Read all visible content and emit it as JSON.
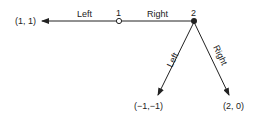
{
  "diagram": {
    "type": "game-tree",
    "nodes": {
      "node1": {
        "label": "1",
        "style": "open-circle"
      },
      "node2": {
        "label": "2",
        "style": "filled-circle"
      }
    },
    "edges": {
      "node1_left": {
        "label": "Left"
      },
      "node1_right": {
        "label": "Right"
      },
      "node2_left": {
        "label": "Left"
      },
      "node2_right": {
        "label": "Right"
      }
    },
    "payoffs": {
      "left_outcome": "(1, 1)",
      "node2_left_outcome": "(−1,−1)",
      "node2_right_outcome": "(2, 0)"
    }
  }
}
